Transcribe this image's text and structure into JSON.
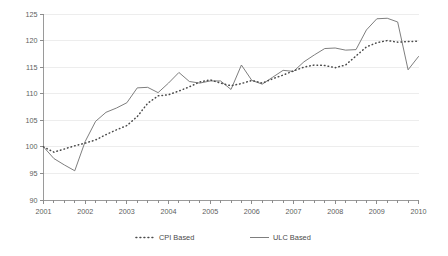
{
  "chart_data": {
    "type": "line",
    "title": "",
    "subtitle": "",
    "xlabel": "",
    "ylabel": "",
    "ylim": [
      90,
      125
    ],
    "yticks": [
      90,
      95,
      100,
      105,
      110,
      115,
      120,
      125
    ],
    "ytick_labels": [
      "90",
      "95",
      "100",
      "105",
      "110",
      "115",
      "120",
      "125"
    ],
    "xlim": [
      "2001",
      "2010"
    ],
    "xticks": [
      2001,
      2002,
      2003,
      2004,
      2005,
      2006,
      2007,
      2008,
      2009,
      2010
    ],
    "xtick_labels": [
      "2001",
      "2002",
      "2003",
      "2004",
      "2005",
      "2006",
      "2007",
      "2008",
      "2009",
      "2010"
    ],
    "grid": "horizontal",
    "legend_position": "bottom",
    "x": [
      2001.0,
      2001.25,
      2001.5,
      2001.75,
      2002.0,
      2002.25,
      2002.5,
      2002.75,
      2003.0,
      2003.25,
      2003.5,
      2003.75,
      2004.0,
      2004.25,
      2004.5,
      2004.75,
      2005.0,
      2005.25,
      2005.5,
      2005.75,
      2006.0,
      2006.25,
      2006.5,
      2006.75,
      2007.0,
      2007.25,
      2007.5,
      2007.75,
      2008.0,
      2008.25,
      2008.5,
      2008.75,
      2009.0,
      2009.25,
      2009.5,
      2009.75,
      2010.0
    ],
    "series": [
      {
        "name": "CPI Based",
        "style": "dotted",
        "color": "#4a4a4a",
        "values": [
          100.0,
          99.0,
          99.6,
          100.2,
          100.7,
          101.3,
          102.3,
          103.2,
          104.0,
          105.7,
          108.2,
          109.6,
          109.8,
          110.5,
          111.3,
          112.2,
          112.6,
          112.0,
          111.5,
          111.9,
          112.5,
          112.0,
          112.8,
          113.5,
          114.3,
          115.0,
          115.4,
          115.3,
          114.9,
          115.4,
          117.1,
          118.8,
          119.6,
          120.0,
          119.7,
          119.8,
          119.9
        ]
      },
      {
        "name": "ULC Based",
        "style": "solid",
        "color": "#6f6f6f",
        "values": [
          100.0,
          97.8,
          96.6,
          95.5,
          101.0,
          104.8,
          106.5,
          107.3,
          108.3,
          111.1,
          111.2,
          110.2,
          112.0,
          114.0,
          112.3,
          112.0,
          112.4,
          112.4,
          110.8,
          115.4,
          112.5,
          111.8,
          113.1,
          114.4,
          114.2,
          116.0,
          117.3,
          118.5,
          118.6,
          118.2,
          118.3,
          122.0,
          124.1,
          124.2,
          123.5,
          114.5,
          117.0
        ]
      }
    ]
  },
  "legend": {
    "items": [
      {
        "label": "CPI Based",
        "style": "dotted"
      },
      {
        "label": "ULC Based",
        "style": "solid"
      }
    ]
  }
}
